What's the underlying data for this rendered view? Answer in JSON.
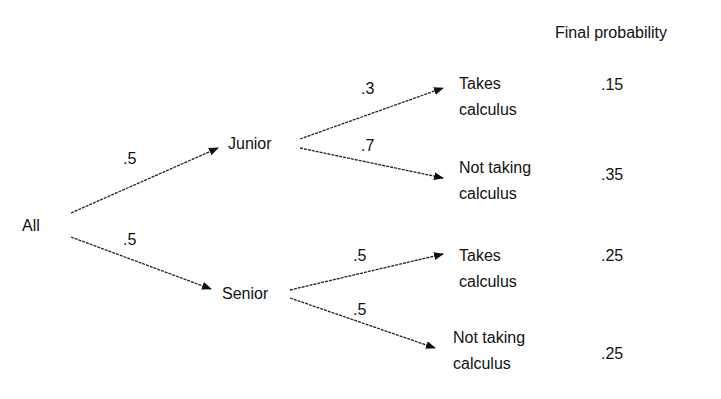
{
  "header": {
    "final_probability_label": "Final probability"
  },
  "root": {
    "label": "All"
  },
  "level1": [
    {
      "label": "Junior",
      "edge_prob": ".5"
    },
    {
      "label": "Senior",
      "edge_prob": ".5"
    }
  ],
  "level2": [
    {
      "line1": "Takes",
      "line2": "calculus",
      "edge_prob": ".3",
      "final": ".15"
    },
    {
      "line1": "Not taking",
      "line2": "calculus",
      "edge_prob": ".7",
      "final": ".35"
    },
    {
      "line1": "Takes",
      "line2": "calculus",
      "edge_prob": ".5",
      "final": ".25"
    },
    {
      "line1": "Not taking",
      "line2": "calculus",
      "edge_prob": ".5",
      "final": ".25"
    }
  ],
  "colors": {
    "line": "#222222",
    "text": "#111111",
    "background": "#ffffff"
  }
}
